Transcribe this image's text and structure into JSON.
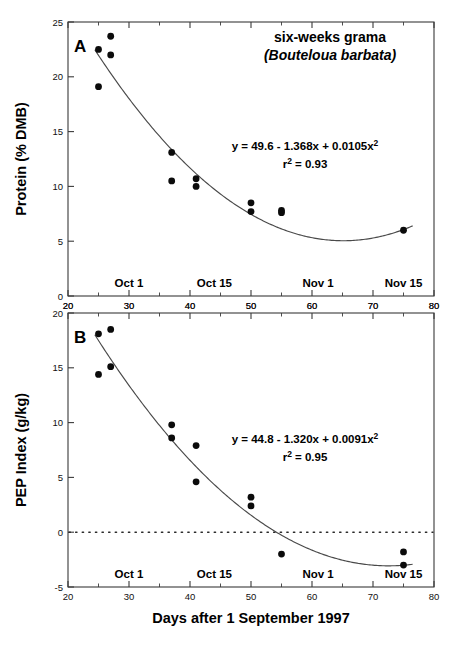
{
  "figure": {
    "xlabel": "Days after 1 September 1997",
    "x_axis": {
      "min": 20,
      "max": 80,
      "ticks": [
        20,
        30,
        40,
        50,
        60,
        70,
        80
      ],
      "minor_ticks": [
        25,
        35,
        45,
        55,
        65,
        75
      ],
      "tick_labels": [
        "20",
        "30",
        "40",
        "50",
        "60",
        "70",
        "80"
      ]
    },
    "date_markers": [
      {
        "label": "Oct 1",
        "x": 30
      },
      {
        "label": "Oct 15",
        "x": 44
      },
      {
        "label": "Nov 1",
        "x": 61
      },
      {
        "label": "Nov 15",
        "x": 75
      }
    ],
    "species": {
      "common_name": "six-weeks grama",
      "scientific_name": "(Bouteloua barbata)"
    },
    "point_color": "#0b0b0b",
    "line_color": "#4a4a4a",
    "axis_color": "#3a3a3a"
  },
  "chart_data": [
    {
      "type": "scatter",
      "panel": "A",
      "title": "six-weeks grama (Bouteloua barbata)",
      "xlabel": "Days after 1 September 1997",
      "ylabel": "Protein (% DMB)",
      "xlim": [
        20,
        80
      ],
      "ylim": [
        0,
        25
      ],
      "yticks": [
        0,
        5,
        10,
        15,
        20,
        25
      ],
      "ytick_labels": [
        "0",
        "5",
        "10",
        "15",
        "20",
        "25"
      ],
      "grid": false,
      "legend": null,
      "equation": "y = 49.6 - 1.368x + 0.0105x",
      "equation_exponent": "2",
      "r_squared_label": "r",
      "r_squared_exponent": "2",
      "r_squared_value": " = 0.93",
      "fit": {
        "a": 49.6,
        "b": -1.368,
        "c": 0.0105,
        "r2": 0.93
      },
      "x": [
        25,
        25,
        27,
        27,
        25,
        37,
        37,
        41,
        41,
        50,
        50,
        55,
        55,
        75
      ],
      "y": [
        22.5,
        19.1,
        23.7,
        22.0,
        22.5,
        13.1,
        10.5,
        10.7,
        10.0,
        8.5,
        7.7,
        7.8,
        7.6,
        6.0
      ],
      "points": [
        {
          "x": 25,
          "y": 22.5
        },
        {
          "x": 25,
          "y": 19.1
        },
        {
          "x": 27,
          "y": 23.7
        },
        {
          "x": 27,
          "y": 22.0
        },
        {
          "x": 37,
          "y": 13.1
        },
        {
          "x": 37,
          "y": 10.5
        },
        {
          "x": 41,
          "y": 10.7
        },
        {
          "x": 41,
          "y": 10.0
        },
        {
          "x": 50,
          "y": 8.5
        },
        {
          "x": 50,
          "y": 7.7
        },
        {
          "x": 55,
          "y": 7.8
        },
        {
          "x": 55,
          "y": 7.6
        },
        {
          "x": 75,
          "y": 6.0
        }
      ]
    },
    {
      "type": "scatter",
      "panel": "B",
      "title": "",
      "xlabel": "Days after 1 September 1997",
      "ylabel": "PEP Index (g/kg)",
      "xlim": [
        20,
        80
      ],
      "ylim": [
        -5,
        20
      ],
      "yticks": [
        -5,
        0,
        5,
        10,
        15,
        20
      ],
      "ytick_labels": [
        "-5",
        "0",
        "5",
        "10",
        "15",
        "20"
      ],
      "grid": false,
      "legend": null,
      "zero_line": 0,
      "equation": "y = 44.8 - 1.320x + 0.0091x",
      "equation_exponent": "2",
      "r_squared_label": "r",
      "r_squared_exponent": "2",
      "r_squared_value": " = 0.95",
      "fit": {
        "a": 44.8,
        "b": -1.32,
        "c": 0.0091,
        "r2": 0.95
      },
      "x": [
        25,
        25,
        27,
        27,
        37,
        37,
        41,
        41,
        50,
        50,
        55,
        75,
        75
      ],
      "y": [
        18.1,
        14.4,
        18.5,
        15.1,
        9.8,
        8.6,
        7.9,
        4.6,
        3.2,
        2.4,
        -2.0,
        -1.8,
        -3.0
      ],
      "points": [
        {
          "x": 25,
          "y": 18.1
        },
        {
          "x": 25,
          "y": 14.4
        },
        {
          "x": 27,
          "y": 18.5
        },
        {
          "x": 27,
          "y": 15.1
        },
        {
          "x": 37,
          "y": 9.8
        },
        {
          "x": 37,
          "y": 8.6
        },
        {
          "x": 41,
          "y": 7.9
        },
        {
          "x": 41,
          "y": 4.6
        },
        {
          "x": 50,
          "y": 3.2
        },
        {
          "x": 50,
          "y": 2.4
        },
        {
          "x": 55,
          "y": -2.0
        },
        {
          "x": 75,
          "y": -1.8
        },
        {
          "x": 75,
          "y": -3.0
        }
      ]
    }
  ]
}
